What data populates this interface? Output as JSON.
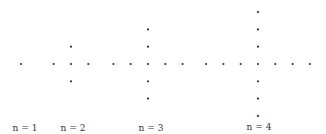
{
  "figure": {
    "dot_color": "#333333",
    "label_color": "#333333",
    "dot_spacing_px": 17.3,
    "patterns": [
      {
        "label": "n = 1",
        "center": [
          21,
          64
        ],
        "arm_length": 0,
        "label_pos": [
          25,
          131
        ]
      },
      {
        "label": "n = 2",
        "center": [
          71,
          64
        ],
        "arm_length": 1,
        "label_pos": [
          73,
          131
        ]
      },
      {
        "label": "n = 3",
        "center": [
          148,
          64
        ],
        "arm_length": 2,
        "label_pos": [
          151,
          131
        ]
      },
      {
        "label": "n = 4",
        "center": [
          258,
          64
        ],
        "arm_length": 3,
        "label_pos": [
          259,
          130
        ]
      }
    ]
  }
}
